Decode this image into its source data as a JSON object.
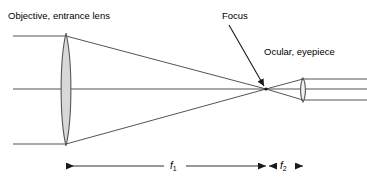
{
  "figure": {
    "type": "optical-ray-diagram",
    "width": 367,
    "height": 183,
    "background_color": "#ffffff"
  },
  "labels": {
    "objective": "Objective, entrance lens",
    "focus": "Focus",
    "ocular": "Ocular, eyepiece",
    "f1": "f",
    "f1_sub": "1",
    "f2": "f",
    "f2_sub": "2"
  },
  "colors": {
    "line": "#404040",
    "lens_stroke": "#555555",
    "lens_fill": "#d8d8d8",
    "text": "#000000",
    "arrow": "#1a1a1a"
  },
  "optics": {
    "optical_axis_y": 89,
    "axis_start_x": 13,
    "axis_end_x": 367,
    "objective_lens": {
      "name": "objective-lens",
      "center_x": 66,
      "top_y": 33,
      "bottom_y": 146,
      "half_width": 6.5,
      "shape": "biconvex"
    },
    "ocular_lens": {
      "name": "ocular-lens",
      "center_x": 303,
      "top_y": 78,
      "bottom_y": 102,
      "half_width": 3.2,
      "shape": "biconvex"
    },
    "focus_point": {
      "x": 266,
      "y": 89
    },
    "incoming_rays": [
      {
        "name": "upper-parallel-ray",
        "y": 36,
        "x_start": 13,
        "x_end": 66
      },
      {
        "name": "axis-ray",
        "y": 89,
        "x_start": 13,
        "x_end": 66
      },
      {
        "name": "lower-parallel-ray",
        "y": 144,
        "x_start": 13,
        "x_end": 66
      }
    ],
    "converging_rays": [
      {
        "name": "upper-converging-ray",
        "x1": 66,
        "y1": 36,
        "x2": 266,
        "y2": 89
      },
      {
        "name": "lower-converging-ray",
        "x1": 66,
        "y1": 144,
        "x2": 266,
        "y2": 89
      }
    ],
    "diverging_rays": [
      {
        "name": "upper-diverging-ray",
        "x1": 266,
        "y1": 89,
        "x2": 303,
        "y2": 79
      },
      {
        "name": "lower-diverging-ray",
        "x1": 266,
        "y1": 89,
        "x2": 303,
        "y2": 100
      }
    ],
    "exit_rays": [
      {
        "name": "upper-exit-ray",
        "y": 79,
        "x_start": 303,
        "x_end": 367
      },
      {
        "name": "axis-exit-ray",
        "y": 89,
        "x_start": 303,
        "x_end": 367
      },
      {
        "name": "lower-exit-ray",
        "y": 100,
        "x_start": 303,
        "x_end": 367
      }
    ]
  },
  "annotations": {
    "focus_pointer": {
      "x1": 229,
      "y1": 25,
      "x2": 265,
      "y2": 87
    }
  },
  "dimensions": [
    {
      "name": "f1-dimension",
      "label_key": "f1",
      "y": 166,
      "x_start": 66,
      "x_end": 266,
      "arrow_left": true,
      "arrow_right": true,
      "gap_start": 164,
      "gap_end": 186
    },
    {
      "name": "f2-dimension",
      "label_key": "f2",
      "y": 166,
      "x_start": 268,
      "x_end": 304,
      "arrow_left": true,
      "arrow_right": true,
      "gap_start": 276,
      "gap_end": 296
    }
  ]
}
